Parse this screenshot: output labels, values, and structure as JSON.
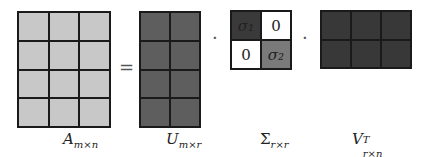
{
  "diagram": {
    "equals": "=",
    "dot": "·",
    "matrices": {
      "A": {
        "rows": 4,
        "cols": 3,
        "color": "#c8c8c8",
        "label_main": "A",
        "label_sub": "m×n"
      },
      "U": {
        "rows": 4,
        "cols": 2,
        "color": "#5e5e5e",
        "label_main": "U",
        "label_sub": "m×r"
      },
      "Sigma": {
        "rows": 2,
        "cols": 2,
        "cells": [
          {
            "text": "σ₁",
            "color": "#3a3a3a"
          },
          {
            "text": "0",
            "color": "#ffffff"
          },
          {
            "text": "0",
            "color": "#ffffff"
          },
          {
            "text": "σ₂",
            "color": "#7a7a7a"
          }
        ],
        "label_main": "Σ",
        "label_sub": "r×r"
      },
      "V": {
        "rows": 2,
        "cols": 3,
        "color": "#383838",
        "label_main": "V",
        "label_sup": "T",
        "label_sub": "r×n"
      }
    }
  }
}
